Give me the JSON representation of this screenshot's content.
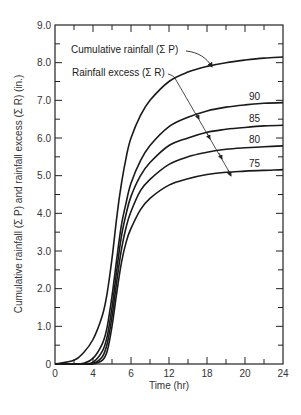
{
  "chart_data": {
    "type": "line",
    "title": "",
    "xlabel": "Time (hr)",
    "ylabel": "Cumulative rainfall (Σ P) and rainfall excess (Σ R) (in.)",
    "xlim": [
      0,
      24
    ],
    "ylim": [
      0,
      9.0
    ],
    "grid": false,
    "x_tick_labels": [
      "0",
      "4",
      "6",
      "12",
      "18",
      "20",
      "24"
    ],
    "x_tick_label_positions": [
      0,
      4,
      8,
      12,
      16,
      20,
      24
    ],
    "y_tick_labels": [
      "0",
      "1.0",
      "2.0",
      "3.0",
      "4.0",
      "5.0",
      "6.0",
      "7.0",
      "8.0",
      "9.0"
    ],
    "y_tick_values": [
      0,
      1,
      2,
      3,
      4,
      5,
      6,
      7,
      8,
      9
    ],
    "x": [
      0,
      2,
      3,
      4,
      5,
      5.5,
      6,
      6.5,
      7,
      7.5,
      8,
      9,
      10,
      12,
      14,
      16,
      18,
      20,
      22,
      24
    ],
    "series": [
      {
        "name": "Cumulative rainfall (Σ P)",
        "values": [
          0,
          0.1,
          0.3,
          0.65,
          1.3,
          1.9,
          2.8,
          3.9,
          4.8,
          5.5,
          6.0,
          6.6,
          7.0,
          7.5,
          7.75,
          7.9,
          8.0,
          8.07,
          8.12,
          8.15
        ]
      },
      {
        "name": "90",
        "values": [
          0,
          0,
          0.02,
          0.15,
          0.55,
          1.0,
          1.8,
          2.8,
          3.7,
          4.3,
          4.8,
          5.4,
          5.8,
          6.3,
          6.55,
          6.72,
          6.82,
          6.88,
          6.92,
          6.94
        ]
      },
      {
        "name": "85",
        "values": [
          0,
          0,
          0,
          0.05,
          0.35,
          0.75,
          1.5,
          2.5,
          3.4,
          4.0,
          4.45,
          5.0,
          5.35,
          5.8,
          6.0,
          6.15,
          6.23,
          6.28,
          6.32,
          6.34
        ]
      },
      {
        "name": "80",
        "values": [
          0,
          0,
          0,
          0.01,
          0.2,
          0.55,
          1.25,
          2.2,
          3.05,
          3.65,
          4.05,
          4.6,
          4.9,
          5.3,
          5.5,
          5.62,
          5.7,
          5.74,
          5.77,
          5.79
        ]
      },
      {
        "name": "75",
        "values": [
          0,
          0,
          0,
          0,
          0.1,
          0.35,
          1.0,
          1.9,
          2.7,
          3.25,
          3.6,
          4.1,
          4.4,
          4.75,
          4.92,
          5.03,
          5.09,
          5.12,
          5.14,
          5.16
        ]
      }
    ],
    "annotations": [
      {
        "text": "Cumulative rainfall (Σ P)",
        "arrow_to": "Σ P curve"
      },
      {
        "text": "Rainfall excess (Σ R)",
        "arrow_to": "90/85/80/75 curves"
      },
      {
        "text": "90"
      },
      {
        "text": "85"
      },
      {
        "text": "80"
      },
      {
        "text": "75"
      }
    ]
  },
  "labels": {
    "xlabel": "Time (hr)",
    "ylabel": "Cumulative rainfall (Σ P) and rainfall excess (Σ R) (in.)",
    "annot_p": "Cumulative rainfall (Σ P)",
    "annot_r": "Rainfall excess (Σ R)",
    "cn90": "90",
    "cn85": "85",
    "cn80": "80",
    "cn75": "75"
  }
}
